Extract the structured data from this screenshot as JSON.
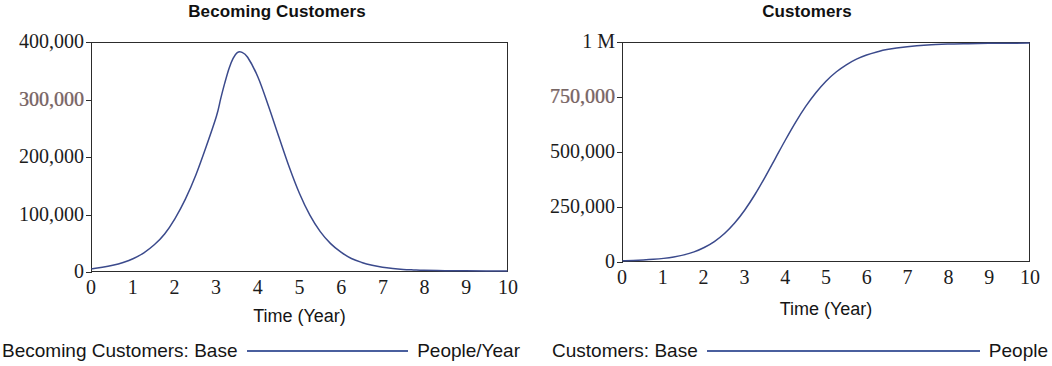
{
  "chart_data": [
    {
      "type": "line",
      "title": "Becoming Customers",
      "xlabel": "Time (Year)",
      "ylabel": "",
      "xlim": [
        0,
        10
      ],
      "ylim": [
        0,
        400000
      ],
      "xticks": [
        "0",
        "1",
        "2",
        "3",
        "4",
        "5",
        "6",
        "7",
        "8",
        "9",
        "10"
      ],
      "yticks": [
        "0",
        "100,000",
        "200,000",
        "300,000",
        "400,000"
      ],
      "ytick_values": [
        0,
        100000,
        200000,
        300000,
        400000
      ],
      "grid": false,
      "legend_position": "below",
      "legend": [
        {
          "name": "Becoming Customers: Base",
          "unit": "People/Year",
          "color": "#4a5f9e"
        }
      ],
      "series": [
        {
          "name": "Becoming Customers: Base",
          "color": "#3b4a8c",
          "x": [
            0,
            0.25,
            0.5,
            0.75,
            1,
            1.25,
            1.5,
            1.75,
            2,
            2.25,
            2.5,
            2.75,
            3,
            3.1,
            3.2,
            3.3,
            3.4,
            3.5,
            3.6,
            3.75,
            4,
            4.25,
            4.5,
            4.75,
            5,
            5.25,
            5.5,
            5.75,
            6,
            6.25,
            6.5,
            6.75,
            7,
            7.25,
            7.5,
            7.75,
            8,
            8.5,
            9,
            9.5,
            10
          ],
          "y": [
            4000,
            6500,
            10000,
            15000,
            22000,
            32000,
            46000,
            65000,
            92000,
            126000,
            168000,
            218000,
            272000,
            302000,
            330000,
            355000,
            373000,
            383000,
            384000,
            375000,
            340000,
            290000,
            236000,
            183000,
            136000,
            98000,
            69000,
            48000,
            33000,
            22000,
            15000,
            10000,
            6500,
            4300,
            2800,
            1900,
            1200,
            600,
            300,
            150,
            80
          ]
        }
      ]
    },
    {
      "type": "line",
      "title": "Customers",
      "xlabel": "Time (Year)",
      "ylabel": "",
      "xlim": [
        0,
        10
      ],
      "ylim": [
        0,
        1000000
      ],
      "xticks": [
        "0",
        "1",
        "2",
        "3",
        "4",
        "5",
        "6",
        "7",
        "8",
        "9",
        "10"
      ],
      "yticks": [
        "0",
        "250,000",
        "500,000",
        "750,000",
        "1 M"
      ],
      "ytick_values": [
        0,
        250000,
        500000,
        750000,
        1000000
      ],
      "grid": false,
      "legend_position": "below",
      "legend": [
        {
          "name": "Customers: Base",
          "unit": "People",
          "color": "#4a5f9e"
        }
      ],
      "series": [
        {
          "name": "Customers: Base",
          "color": "#3b4a8c",
          "x": [
            0,
            0.25,
            0.5,
            0.75,
            1,
            1.25,
            1.5,
            1.75,
            2,
            2.25,
            2.5,
            2.75,
            3,
            3.25,
            3.5,
            3.75,
            4,
            4.25,
            4.5,
            4.75,
            5,
            5.25,
            5.5,
            5.75,
            6,
            6.25,
            6.5,
            7,
            7.5,
            8,
            8.5,
            9,
            9.5,
            10
          ],
          "y": [
            1000,
            2300,
            4400,
            7500,
            12000,
            18500,
            28000,
            42000,
            62000,
            89000,
            126000,
            174000,
            234000,
            305000,
            385000,
            470000,
            555000,
            636000,
            709000,
            772000,
            825000,
            867000,
            900000,
            926000,
            945000,
            959000,
            970000,
            983000,
            991000,
            995000,
            997000,
            998500,
            999000,
            999500
          ]
        }
      ]
    }
  ],
  "panels": [
    {
      "title": "Becoming Customers",
      "axis_title": "Time (Year)",
      "yticks": [
        "400,000",
        "300,000",
        "200,000",
        "100,000",
        "0"
      ],
      "ytick_faded": [
        false,
        true,
        false,
        false,
        false
      ],
      "xticks": [
        "0",
        "1",
        "2",
        "3",
        "4",
        "5",
        "6",
        "7",
        "8",
        "9",
        "10"
      ],
      "legend_name": "Becoming Customers: Base",
      "legend_unit": "People/Year"
    },
    {
      "title": "Customers",
      "axis_title": "Time (Year)",
      "yticks": [
        "1 M",
        "750,000",
        "500,000",
        "250,000",
        "0"
      ],
      "ytick_faded": [
        false,
        true,
        false,
        false,
        false
      ],
      "xticks": [
        "0",
        "1",
        "2",
        "3",
        "4",
        "5",
        "6",
        "7",
        "8",
        "9",
        "10"
      ],
      "legend_name": "Customers: Base",
      "legend_unit": "People"
    }
  ],
  "colors": {
    "line": "#3b4a8c",
    "legend_line": "#4a5f9e",
    "axis": "#2c2c2c",
    "text": "#1a1a1a",
    "background": "#ffffff"
  }
}
